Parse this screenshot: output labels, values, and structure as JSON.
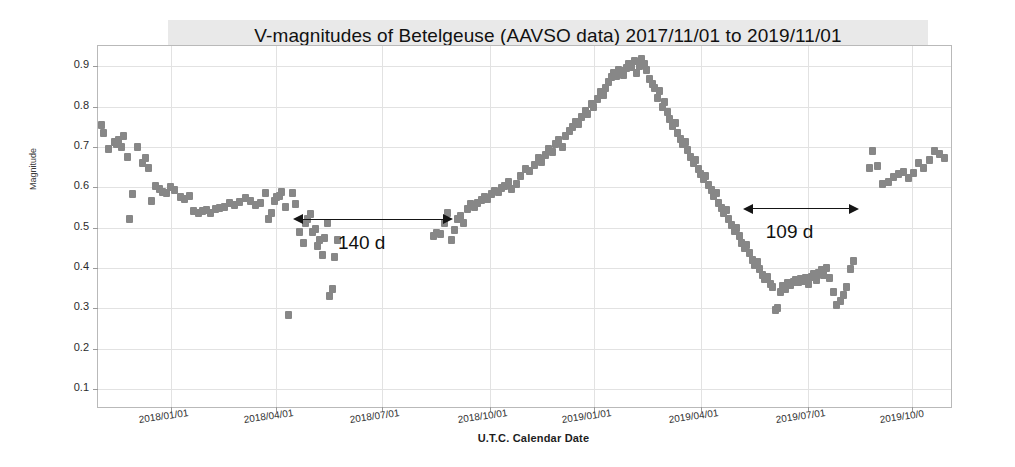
{
  "chart_data": {
    "type": "scatter",
    "title": "V-magnitudes of Betelgeuse (AAVSO data) 2017/11/01 to 2019/11/01",
    "xlabel": "U.T.C. Calendar Date",
    "ylabel": "Magnitude",
    "y_inverted": true,
    "ylim": [
      0.95,
      0.05
    ],
    "yticks": [
      "0.1",
      "0.2",
      "0.3",
      "0.4",
      "0.5",
      "0.6",
      "0.7",
      "0.8",
      "0.9"
    ],
    "ytick_values": [
      0.1,
      0.2,
      0.3,
      0.4,
      0.5,
      0.6,
      0.7,
      0.8,
      0.9
    ],
    "xlim": [
      "2017/11/01",
      "2019/11/01"
    ],
    "xticks": [
      "2018/01/01",
      "2018/04/01",
      "2018/07/01",
      "2018/10/01",
      "2019/01/01",
      "2019/04/01",
      "2019/07/01",
      "2019/10/0"
    ],
    "xtick_fractions": [
      0.085,
      0.208,
      0.332,
      0.458,
      0.58,
      0.705,
      0.83,
      0.952
    ],
    "grid": true,
    "legend": false,
    "marker": "square",
    "marker_color": "#878787",
    "series_name": "V magnitude",
    "annotations": [
      {
        "label": "140 d",
        "x_start_frac": 0.228,
        "x_end_frac": 0.415,
        "y_value": 0.522,
        "text_y_value": 0.452
      },
      {
        "label": "109 d",
        "x_start_frac": 0.754,
        "x_end_frac": 0.89,
        "y_value": 0.548,
        "text_y_value": 0.478
      }
    ],
    "points": [
      [
        0.004,
        0.755
      ],
      [
        0.006,
        0.735
      ],
      [
        0.012,
        0.695
      ],
      [
        0.019,
        0.712
      ],
      [
        0.022,
        0.706
      ],
      [
        0.024,
        0.716
      ],
      [
        0.027,
        0.7
      ],
      [
        0.03,
        0.728
      ],
      [
        0.034,
        0.675
      ],
      [
        0.037,
        0.521
      ],
      [
        0.04,
        0.583
      ],
      [
        0.046,
        0.7
      ],
      [
        0.052,
        0.66
      ],
      [
        0.055,
        0.672
      ],
      [
        0.059,
        0.648
      ],
      [
        0.063,
        0.566
      ],
      [
        0.067,
        0.604
      ],
      [
        0.072,
        0.596
      ],
      [
        0.076,
        0.588
      ],
      [
        0.08,
        0.585
      ],
      [
        0.085,
        0.6
      ],
      [
        0.09,
        0.592
      ],
      [
        0.096,
        0.576
      ],
      [
        0.101,
        0.57
      ],
      [
        0.107,
        0.578
      ],
      [
        0.112,
        0.54
      ],
      [
        0.117,
        0.535
      ],
      [
        0.122,
        0.54
      ],
      [
        0.127,
        0.543
      ],
      [
        0.132,
        0.536
      ],
      [
        0.137,
        0.545
      ],
      [
        0.142,
        0.548
      ],
      [
        0.148,
        0.551
      ],
      [
        0.154,
        0.56
      ],
      [
        0.16,
        0.555
      ],
      [
        0.166,
        0.563
      ],
      [
        0.172,
        0.572
      ],
      [
        0.178,
        0.566
      ],
      [
        0.184,
        0.556
      ],
      [
        0.19,
        0.56
      ],
      [
        0.196,
        0.585
      ],
      [
        0.199,
        0.52
      ],
      [
        0.203,
        0.536
      ],
      [
        0.206,
        0.565
      ],
      [
        0.209,
        0.576
      ],
      [
        0.212,
        0.578
      ],
      [
        0.215,
        0.588
      ],
      [
        0.219,
        0.552
      ],
      [
        0.223,
        0.283
      ],
      [
        0.227,
        0.586
      ],
      [
        0.231,
        0.558
      ],
      [
        0.236,
        0.49
      ],
      [
        0.24,
        0.462
      ],
      [
        0.243,
        0.512
      ],
      [
        0.245,
        0.52
      ],
      [
        0.248,
        0.533
      ],
      [
        0.251,
        0.489
      ],
      [
        0.254,
        0.497
      ],
      [
        0.257,
        0.455
      ],
      [
        0.259,
        0.47
      ],
      [
        0.262,
        0.432
      ],
      [
        0.265,
        0.475
      ],
      [
        0.268,
        0.512
      ],
      [
        0.271,
        0.33
      ],
      [
        0.274,
        0.348
      ],
      [
        0.277,
        0.428
      ],
      [
        0.28,
        0.468
      ],
      [
        0.392,
        0.48
      ],
      [
        0.396,
        0.487
      ],
      [
        0.4,
        0.483
      ],
      [
        0.405,
        0.51
      ],
      [
        0.409,
        0.537
      ],
      [
        0.413,
        0.47
      ],
      [
        0.417,
        0.495
      ],
      [
        0.42,
        0.52
      ],
      [
        0.424,
        0.528
      ],
      [
        0.428,
        0.512
      ],
      [
        0.432,
        0.545
      ],
      [
        0.436,
        0.558
      ],
      [
        0.44,
        0.552
      ],
      [
        0.444,
        0.56
      ],
      [
        0.448,
        0.568
      ],
      [
        0.452,
        0.575
      ],
      [
        0.456,
        0.57
      ],
      [
        0.46,
        0.582
      ],
      [
        0.464,
        0.59
      ],
      [
        0.468,
        0.588
      ],
      [
        0.472,
        0.598
      ],
      [
        0.476,
        0.604
      ],
      [
        0.48,
        0.612
      ],
      [
        0.484,
        0.596
      ],
      [
        0.489,
        0.608
      ],
      [
        0.494,
        0.628
      ],
      [
        0.5,
        0.646
      ],
      [
        0.505,
        0.64
      ],
      [
        0.51,
        0.655
      ],
      [
        0.515,
        0.672
      ],
      [
        0.519,
        0.663
      ],
      [
        0.523,
        0.68
      ],
      [
        0.527,
        0.694
      ],
      [
        0.531,
        0.688
      ],
      [
        0.535,
        0.706
      ],
      [
        0.539,
        0.716
      ],
      [
        0.543,
        0.7
      ],
      [
        0.547,
        0.728
      ],
      [
        0.551,
        0.74
      ],
      [
        0.555,
        0.748
      ],
      [
        0.558,
        0.762
      ],
      [
        0.562,
        0.756
      ],
      [
        0.566,
        0.775
      ],
      [
        0.57,
        0.79
      ],
      [
        0.573,
        0.782
      ],
      [
        0.577,
        0.806
      ],
      [
        0.58,
        0.8
      ],
      [
        0.584,
        0.818
      ],
      [
        0.588,
        0.836
      ],
      [
        0.591,
        0.828
      ],
      [
        0.594,
        0.845
      ],
      [
        0.597,
        0.86
      ],
      [
        0.6,
        0.872
      ],
      [
        0.603,
        0.882
      ],
      [
        0.606,
        0.876
      ],
      [
        0.609,
        0.89
      ],
      [
        0.612,
        0.888
      ],
      [
        0.615,
        0.878
      ],
      [
        0.618,
        0.896
      ],
      [
        0.621,
        0.905
      ],
      [
        0.624,
        0.898
      ],
      [
        0.627,
        0.912
      ],
      [
        0.63,
        0.884
      ],
      [
        0.633,
        0.9
      ],
      [
        0.636,
        0.918
      ],
      [
        0.639,
        0.905
      ],
      [
        0.642,
        0.89
      ],
      [
        0.645,
        0.868
      ],
      [
        0.648,
        0.856
      ],
      [
        0.651,
        0.845
      ],
      [
        0.654,
        0.822
      ],
      [
        0.657,
        0.838
      ],
      [
        0.66,
        0.8
      ],
      [
        0.663,
        0.812
      ],
      [
        0.666,
        0.786
      ],
      [
        0.669,
        0.77
      ],
      [
        0.672,
        0.752
      ],
      [
        0.675,
        0.758
      ],
      [
        0.678,
        0.735
      ],
      [
        0.681,
        0.72
      ],
      [
        0.684,
        0.706
      ],
      [
        0.687,
        0.712
      ],
      [
        0.69,
        0.692
      ],
      [
        0.693,
        0.675
      ],
      [
        0.696,
        0.66
      ],
      [
        0.699,
        0.668
      ],
      [
        0.702,
        0.645
      ],
      [
        0.705,
        0.632
      ],
      [
        0.708,
        0.62
      ],
      [
        0.711,
        0.628
      ],
      [
        0.714,
        0.606
      ],
      [
        0.717,
        0.592
      ],
      [
        0.72,
        0.578
      ],
      [
        0.723,
        0.586
      ],
      [
        0.726,
        0.56
      ],
      [
        0.729,
        0.548
      ],
      [
        0.732,
        0.536
      ],
      [
        0.735,
        0.544
      ],
      [
        0.738,
        0.52
      ],
      [
        0.741,
        0.505
      ],
      [
        0.744,
        0.492
      ],
      [
        0.747,
        0.5
      ],
      [
        0.75,
        0.478
      ],
      [
        0.753,
        0.462
      ],
      [
        0.756,
        0.448
      ],
      [
        0.759,
        0.456
      ],
      [
        0.762,
        0.436
      ],
      [
        0.765,
        0.42
      ],
      [
        0.768,
        0.408
      ],
      [
        0.771,
        0.414
      ],
      [
        0.774,
        0.398
      ],
      [
        0.777,
        0.382
      ],
      [
        0.78,
        0.372
      ],
      [
        0.783,
        0.378
      ],
      [
        0.786,
        0.36
      ],
      [
        0.789,
        0.352
      ],
      [
        0.792,
        0.296
      ],
      [
        0.795,
        0.3
      ],
      [
        0.798,
        0.34
      ],
      [
        0.801,
        0.356
      ],
      [
        0.804,
        0.348
      ],
      [
        0.807,
        0.362
      ],
      [
        0.81,
        0.358
      ],
      [
        0.813,
        0.366
      ],
      [
        0.816,
        0.37
      ],
      [
        0.819,
        0.364
      ],
      [
        0.822,
        0.372
      ],
      [
        0.825,
        0.368
      ],
      [
        0.828,
        0.375
      ],
      [
        0.831,
        0.36
      ],
      [
        0.834,
        0.378
      ],
      [
        0.837,
        0.384
      ],
      [
        0.84,
        0.37
      ],
      [
        0.843,
        0.388
      ],
      [
        0.846,
        0.395
      ],
      [
        0.849,
        0.382
      ],
      [
        0.852,
        0.4
      ],
      [
        0.856,
        0.374
      ],
      [
        0.86,
        0.34
      ],
      [
        0.864,
        0.308
      ],
      [
        0.868,
        0.318
      ],
      [
        0.872,
        0.332
      ],
      [
        0.876,
        0.352
      ],
      [
        0.88,
        0.398
      ],
      [
        0.884,
        0.418
      ],
      [
        0.902,
        0.648
      ],
      [
        0.906,
        0.69
      ],
      [
        0.912,
        0.652
      ],
      [
        0.918,
        0.608
      ],
      [
        0.924,
        0.614
      ],
      [
        0.93,
        0.625
      ],
      [
        0.936,
        0.632
      ],
      [
        0.942,
        0.638
      ],
      [
        0.948,
        0.622
      ],
      [
        0.954,
        0.636
      ],
      [
        0.96,
        0.66
      ],
      [
        0.966,
        0.648
      ],
      [
        0.972,
        0.668
      ],
      [
        0.978,
        0.69
      ],
      [
        0.984,
        0.682
      ],
      [
        0.99,
        0.672
      ]
    ]
  }
}
